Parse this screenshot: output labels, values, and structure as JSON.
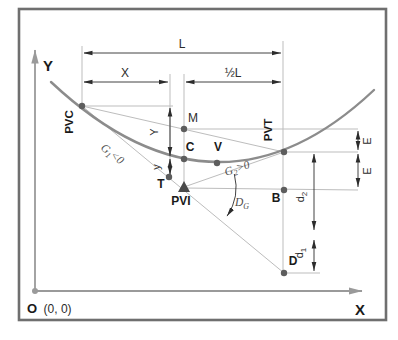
{
  "diagram": {
    "title_semantic": "vertical-parabolic-curve-geometry",
    "axes": {
      "x_label": "X",
      "y_label": "Y",
      "origin_main": "O",
      "origin_coords": "(0, 0)"
    },
    "points": {
      "pvc": "PVC",
      "pvt": "PVT",
      "pvi": "PVI",
      "t": "T",
      "c": "C",
      "v": "V",
      "m": "M",
      "b": "B",
      "d": "D"
    },
    "dims": {
      "l": "L",
      "x": "X",
      "half_l": "½L",
      "y_upper": "Y",
      "y_lower": "y",
      "e_upper": "E",
      "e_lower": "E",
      "d2_main": "d",
      "d2_sub": "2",
      "d1_main": "d",
      "d1_sub": "1"
    },
    "grades": {
      "g1_main": "G",
      "g1_sub": "1",
      "g1_rest": "<0",
      "g2_main": "G",
      "g2_sub": "2",
      "g2_rest": ">0",
      "dg_main": "D",
      "dg_sub": "G"
    },
    "colors": {
      "frame": "#6f6f6f",
      "curve": "#8c8c8c",
      "construction_lines": "#bdbdbd",
      "dimension_lines": "#2c2c2c",
      "axis": "#9a9a9a",
      "points": "#5d5d5d",
      "text": "#1a1a1a",
      "background": "#ffffff"
    }
  }
}
